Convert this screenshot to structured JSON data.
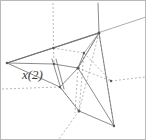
{
  "figure": {
    "type": "geometric-wireframe-diagram",
    "width": 146,
    "height": 140,
    "background_color": "#ffffff",
    "border_color": "#b9b9b9",
    "solid_edge_color": "#6e6e6e",
    "dashed_edge_color": "#9a9a9a",
    "vertex_color": "#5a5a5a",
    "labels": [
      {
        "id": "x2",
        "text": "x(2)",
        "x": 21,
        "y": 66,
        "style": "italic-math"
      }
    ],
    "vertices": [
      {
        "id": "v-left-apex",
        "x": 6,
        "y": 62
      },
      {
        "id": "v-top-right",
        "x": 98,
        "y": 32
      },
      {
        "id": "v-hub-center",
        "x": 77,
        "y": 67
      },
      {
        "id": "v-upper-mid",
        "x": 52,
        "y": 47
      },
      {
        "id": "v-mid-left",
        "x": 53,
        "y": 63
      },
      {
        "id": "v-right-mid",
        "x": 83,
        "y": 52
      },
      {
        "id": "v-lower-left",
        "x": 59,
        "y": 86
      },
      {
        "id": "v-bottom-mid",
        "x": 78,
        "y": 110
      },
      {
        "id": "v-bottom-spike",
        "x": 113,
        "y": 125
      },
      {
        "id": "v-right-node",
        "x": 110,
        "y": 80
      }
    ],
    "solid_edges": [
      {
        "from": "v-left-apex",
        "to": "v-top-right"
      },
      {
        "from": "v-left-apex",
        "to": "v-mid-left"
      },
      {
        "from": "v-left-apex",
        "to": "v-upper-mid"
      },
      {
        "from": "v-mid-left",
        "to": "v-hub-center"
      },
      {
        "from": "v-hub-center",
        "to": "v-top-right"
      },
      {
        "from": "v-hub-center",
        "to": "v-right-mid"
      },
      {
        "from": "v-hub-center",
        "to": "v-lower-left"
      },
      {
        "from": "v-hub-center",
        "to": "v-bottom-spike"
      },
      {
        "from": "v-top-right",
        "to": "v-bottom-spike"
      },
      {
        "from": "v-lower-left",
        "to": "v-bottom-mid"
      },
      {
        "from": "v-bottom-mid",
        "to": "v-bottom-spike"
      },
      {
        "from": "v-upper-mid",
        "to": "v-top-right"
      }
    ],
    "dashed_edges": [
      {
        "from": "v-upper-mid",
        "to": "v-top-edge-ray"
      },
      {
        "from": "v-hub-center",
        "to": "v-bottom-dash-ray"
      },
      {
        "from": "v-left-dash",
        "to": "v-lower-left"
      },
      {
        "from": "v-right-mid",
        "to": "v-bottom-mid"
      },
      {
        "from": "v-top-right",
        "to": "v-bottom-mid"
      },
      {
        "from": "v-hub-center",
        "to": "v-right-node"
      },
      {
        "from": "v-right-node",
        "to": "v-right-edge-ray"
      },
      {
        "from": "v-upper-mid",
        "to": "v-right-mid"
      },
      {
        "from": "v-bottom-mid",
        "to": "v-bottom-left-ray"
      }
    ],
    "long_solid_ray": {
      "description": "shallow line crossing from left apex through top-right toward right edge",
      "from_x": 6,
      "from_y": 62,
      "to_x": 145,
      "to_y": 17
    },
    "vertical_dashed_ray": {
      "description": "vertical dashed line through upper-mid node to top edge",
      "x": 52,
      "from_y": 2,
      "to_y": 47
    }
  }
}
